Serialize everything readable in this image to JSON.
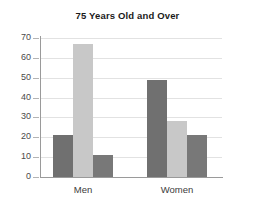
{
  "chart_data": {
    "type": "bar",
    "title": "75 Years Old and Over",
    "xlabel": "",
    "ylabel": "",
    "categories": [
      "Men",
      "Women"
    ],
    "series": [
      {
        "name": "series-1",
        "color": "#707070",
        "values": [
          21,
          49
        ]
      },
      {
        "name": "series-2",
        "color": "#c8c8c8",
        "values": [
          67,
          28
        ]
      },
      {
        "name": "series-3",
        "color": "#787878",
        "values": [
          11,
          21
        ]
      }
    ],
    "ylim": [
      0,
      70
    ],
    "yticks": [
      0,
      10,
      20,
      30,
      40,
      50,
      60,
      70
    ],
    "ytick_labels": [
      "0",
      "10",
      "20",
      "30",
      "40",
      "50",
      "60",
      "70"
    ],
    "grid": true,
    "legend": "none"
  },
  "colors": {
    "background": "#ffffff",
    "axis": "#9a9a9a",
    "grid": "#e2e2e2",
    "title_text": "#1a1a1a",
    "tick_text": "#4a4a4a",
    "category_text": "#3c3c3c"
  }
}
